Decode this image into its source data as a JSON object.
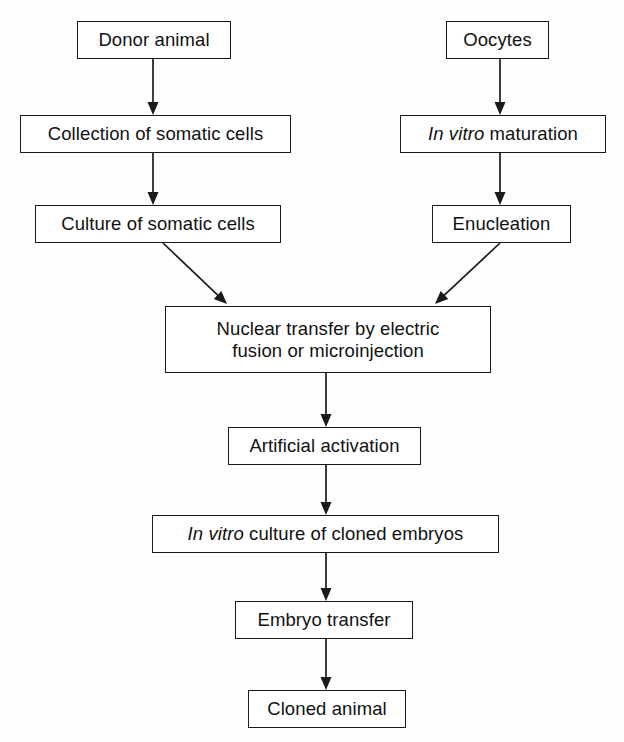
{
  "diagram": {
    "background_color": "#fefefe",
    "line_color": "#1a1a1a",
    "box_fill": "#ffffff",
    "nodes": [
      {
        "id": "donor-animal",
        "label": "Donor animal",
        "italic_prefix": "",
        "x": 77,
        "y": 21,
        "w": 154,
        "h": 38
      },
      {
        "id": "oocytes",
        "label": "Oocytes",
        "italic_prefix": "",
        "x": 446,
        "y": 21,
        "w": 103,
        "h": 38
      },
      {
        "id": "collection-of-somatic-cells",
        "label": "Collection of somatic cells",
        "italic_prefix": "",
        "x": 20,
        "y": 115,
        "w": 271,
        "h": 38
      },
      {
        "id": "in-vitro-maturation",
        "label": " maturation",
        "italic_prefix": "In vitro",
        "x": 400,
        "y": 115,
        "w": 206,
        "h": 38
      },
      {
        "id": "culture-of-somatic-cells",
        "label": "Culture of somatic cells",
        "italic_prefix": "",
        "x": 35,
        "y": 205,
        "w": 246,
        "h": 38
      },
      {
        "id": "enucleation",
        "label": "Enucleation",
        "italic_prefix": "",
        "x": 432,
        "y": 205,
        "w": 139,
        "h": 38
      },
      {
        "id": "nuclear-transfer",
        "label": "Nuclear transfer by electric\nfusion or microinjection",
        "italic_prefix": "",
        "x": 165,
        "y": 306,
        "w": 326,
        "h": 67
      },
      {
        "id": "artificial-activation",
        "label": "Artificial activation",
        "italic_prefix": "",
        "x": 228,
        "y": 427,
        "w": 193,
        "h": 38
      },
      {
        "id": "in-vitro-culture-of-cloned-embryos",
        "label": " culture of cloned embryos",
        "italic_prefix": "In vitro",
        "x": 152,
        "y": 515,
        "w": 347,
        "h": 38
      },
      {
        "id": "embryo-transfer",
        "label": "Embryo transfer",
        "italic_prefix": "",
        "x": 235,
        "y": 601,
        "w": 178,
        "h": 38
      },
      {
        "id": "cloned-animal",
        "label": "Cloned animal",
        "italic_prefix": "",
        "x": 248,
        "y": 690,
        "w": 158,
        "h": 38
      }
    ],
    "edges": [
      {
        "id": "donor-to-collection",
        "from": "donor-animal",
        "to": "collection-of-somatic-cells",
        "x1": 153,
        "y1": 59,
        "x2": 153,
        "y2": 115
      },
      {
        "id": "oocytes-to-maturation",
        "from": "oocytes",
        "to": "in-vitro-maturation",
        "x1": 500,
        "y1": 59,
        "x2": 500,
        "y2": 115
      },
      {
        "id": "collection-to-culture",
        "from": "collection-of-somatic-cells",
        "to": "culture-of-somatic-cells",
        "x1": 153,
        "y1": 153,
        "x2": 153,
        "y2": 205
      },
      {
        "id": "maturation-to-enucleation",
        "from": "in-vitro-maturation",
        "to": "enucleation",
        "x1": 500,
        "y1": 153,
        "x2": 500,
        "y2": 205
      },
      {
        "id": "culture-to-nuclear-transfer",
        "from": "culture-of-somatic-cells",
        "to": "nuclear-transfer",
        "x1": 163,
        "y1": 243,
        "x2": 227,
        "y2": 304
      },
      {
        "id": "enucleation-to-nuclear-transfer",
        "from": "enucleation",
        "to": "nuclear-transfer",
        "x1": 500,
        "y1": 243,
        "x2": 435,
        "y2": 304
      },
      {
        "id": "nuclear-transfer-to-activation",
        "from": "nuclear-transfer",
        "to": "artificial-activation",
        "x1": 326,
        "y1": 373,
        "x2": 326,
        "y2": 427
      },
      {
        "id": "activation-to-culture",
        "from": "artificial-activation",
        "to": "in-vitro-culture-of-cloned-embryos",
        "x1": 326,
        "y1": 465,
        "x2": 326,
        "y2": 515
      },
      {
        "id": "culture-to-embryo-transfer",
        "from": "in-vitro-culture-of-cloned-embryos",
        "to": "embryo-transfer",
        "x1": 326,
        "y1": 553,
        "x2": 326,
        "y2": 601
      },
      {
        "id": "embryo-transfer-to-cloned-animal",
        "from": "embryo-transfer",
        "to": "cloned-animal",
        "x1": 326,
        "y1": 639,
        "x2": 326,
        "y2": 690
      }
    ]
  }
}
